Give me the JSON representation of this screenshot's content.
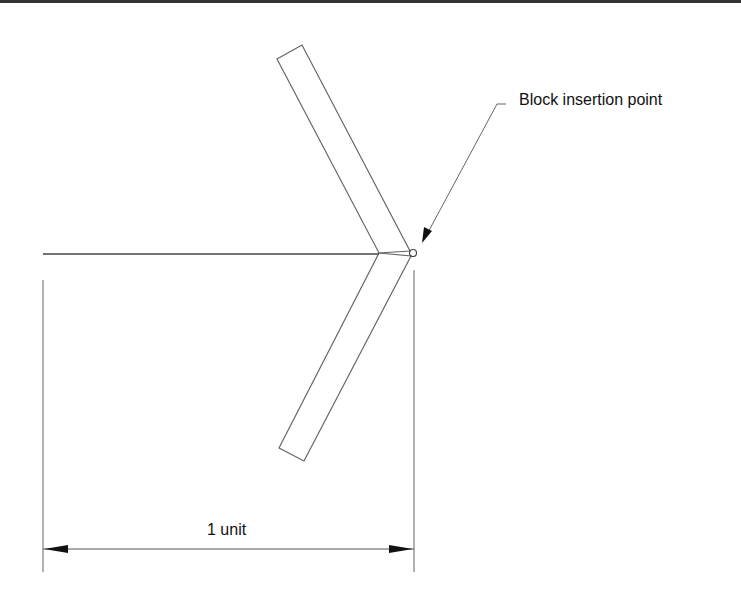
{
  "diagram": {
    "callout_label": "Block insertion point",
    "dimension_label": "1 unit",
    "colors": {
      "line": "#555555",
      "arrow": "#111111",
      "text": "#111111",
      "border": "#333333"
    },
    "shapes": {
      "chevron_upper_bar": {
        "points": [
          [
            277,
            59
          ],
          [
            302,
            45
          ],
          [
            413,
            250
          ],
          [
            379,
            253
          ]
        ]
      },
      "chevron_lower_bar": {
        "points": [
          [
            379,
            253
          ],
          [
            413,
            255
          ],
          [
            304,
            461
          ],
          [
            279,
            448
          ]
        ]
      },
      "horizontal_line": {
        "from": [
          43,
          254
        ],
        "to": [
          379,
          254
        ]
      },
      "insertion_point_circle": {
        "center": [
          413,
          253
        ],
        "radius": 3.5
      },
      "leader": {
        "points": [
          [
            423,
            242
          ],
          [
            497,
            104
          ],
          [
            506,
            104
          ]
        ]
      },
      "extension_left": {
        "from": [
          43,
          280
        ],
        "to": [
          43,
          572
        ]
      },
      "extension_right": {
        "from": [
          414,
          270
        ],
        "to": [
          414,
          572
        ]
      },
      "dimension_line": {
        "from": [
          43,
          549
        ],
        "to": [
          414,
          549
        ]
      }
    }
  }
}
